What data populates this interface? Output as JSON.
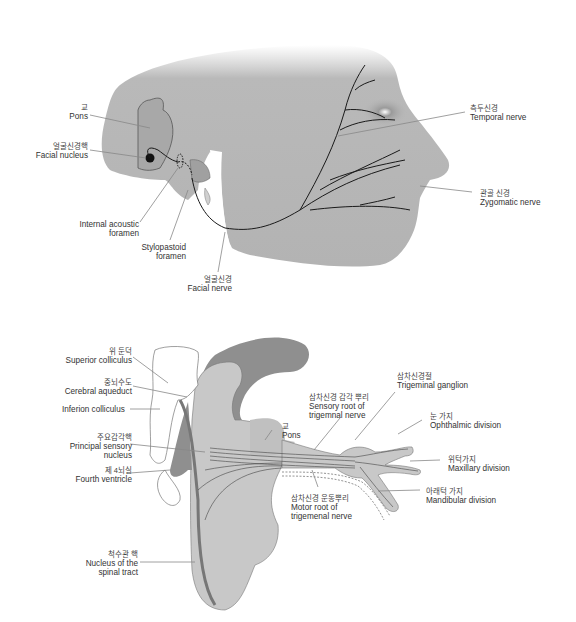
{
  "top_diagram": {
    "title": "Facial nerve pathway",
    "labels": {
      "pons": {
        "ko": "교",
        "en": "Pons"
      },
      "facial_nucleus": {
        "ko": "얼굴신경핵",
        "en": "Facial nucleus"
      },
      "internal_acoustic_foramen": {
        "en1": "Internal acoustic",
        "en2": "foramen"
      },
      "stylomastoid_foramen": {
        "en1": "Stylopastoid",
        "en2": "foramen"
      },
      "facial_nerve": {
        "ko": "얼굴신경",
        "en": "Facial nerve"
      },
      "temporal_nerve": {
        "ko": "측두신경",
        "en": "Temporal nerve"
      },
      "zygomatic_nerve": {
        "ko": "관골 신경",
        "en": "Zygomatic nerve"
      }
    }
  },
  "bottom_diagram": {
    "title": "Trigeminal nerve pathway",
    "labels": {
      "superior_colliculus": {
        "ko": "위 둔덕",
        "en": "Superior colliculus"
      },
      "cerebral_aqueduct": {
        "ko": "중뇌수도",
        "en": "Cerebral aqueduct"
      },
      "inferior_colliculus": {
        "en": "Inferion colliculus"
      },
      "principal_sensory_nucleus": {
        "ko": "주요감각핵",
        "en1": "Principal sensory",
        "en2": "nucleus"
      },
      "fourth_ventricle": {
        "ko": "제 4뇌실",
        "en": "Fourth ventricle"
      },
      "spinal_tract_nucleus": {
        "ko": "척수관 핵",
        "en1": "Nucleus of the",
        "en2": "spinal tract"
      },
      "pons": {
        "ko": "교",
        "en": "Pons"
      },
      "sensory_root": {
        "ko": "삼차신경 감각 뿌리",
        "en1": "Sensory root of",
        "en2": "trigemnal nerve"
      },
      "trigeminal_ganglion": {
        "ko": "삼차신경절",
        "en": "Trigeminal ganglion"
      },
      "ophthalmic_division": {
        "ko": "눈 가지",
        "en": "Ophthalmic division"
      },
      "maxillary_division": {
        "ko": "위턱가지",
        "en": "Maxillary division"
      },
      "mandibular_division": {
        "ko": "아래턱 가지",
        "en": "Mandibular division"
      },
      "motor_root": {
        "ko": "삼차신경 운동뿌리",
        "en1": "Motor root of",
        "en2": "trigemenal nerve"
      }
    }
  },
  "colors": {
    "skin": "#b9b9b9",
    "brain_light": "#c8c8c8",
    "brain_dark": "#8f8f8f",
    "nerve": "#1a1a1a",
    "leader": "#888888"
  }
}
